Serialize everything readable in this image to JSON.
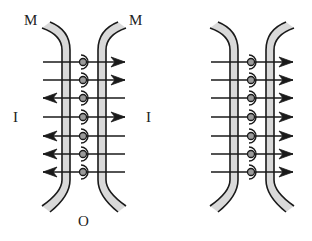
{
  "labels": {
    "m_left": "M",
    "m_right": "M",
    "i_left": "I",
    "i_right": "I",
    "o_bottom": "O"
  },
  "colors": {
    "stroke": "#1a1a1a",
    "membrane_fill": "#d9d9d9",
    "dot_fill": "#9a9a9a",
    "background": "#ffffff"
  },
  "diagrams": [
    {
      "name": "left-diagram",
      "center_x": 84,
      "rows_y": [
        62,
        80,
        98,
        117,
        136,
        154,
        172
      ],
      "arrow_directions": [
        "right",
        "right",
        "left",
        "right",
        "left",
        "left",
        "left"
      ]
    },
    {
      "name": "right-diagram",
      "center_x": 252,
      "rows_y": [
        62,
        80,
        98,
        117,
        136,
        154,
        172
      ],
      "arrow_directions": [
        "right",
        "right",
        "right",
        "right",
        "right",
        "right",
        "right"
      ]
    }
  ]
}
